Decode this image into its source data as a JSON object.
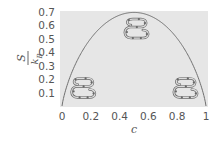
{
  "chart_data": {
    "type": "line",
    "title": "",
    "xlabel": "c",
    "ylabel_numerator": "S",
    "ylabel_denominator": "k_B",
    "xlim": [
      0,
      1
    ],
    "ylim": [
      0,
      0.7
    ],
    "xticks": [
      "0",
      "0.2",
      "0.4",
      "0.6",
      "0.8",
      "1"
    ],
    "yticks": [
      "0.1",
      "0.2",
      "0.3",
      "0.4",
      "0.5",
      "0.6",
      "0.7"
    ],
    "grid": false,
    "legend": null,
    "background": "#e6e6e6",
    "series": [
      {
        "name": "entropy of mixing curve",
        "x": [
          0.0,
          0.02,
          0.05,
          0.1,
          0.2,
          0.3,
          0.4,
          0.5,
          0.6,
          0.7,
          0.8,
          0.9,
          0.95,
          0.98,
          1.0
        ],
        "y": [
          0.0,
          0.098,
          0.199,
          0.325,
          0.5,
          0.611,
          0.673,
          0.693,
          0.673,
          0.611,
          0.5,
          0.325,
          0.199,
          0.098,
          0.0
        ]
      }
    ],
    "annotations": [
      {
        "type": "chain-coil-icon",
        "center_c": 0.15,
        "center_y": 0.13
      },
      {
        "type": "chain-coil-icon",
        "center_c": 0.52,
        "center_y": 0.57
      },
      {
        "type": "chain-coil-icon",
        "center_c": 0.86,
        "center_y": 0.13
      }
    ]
  }
}
